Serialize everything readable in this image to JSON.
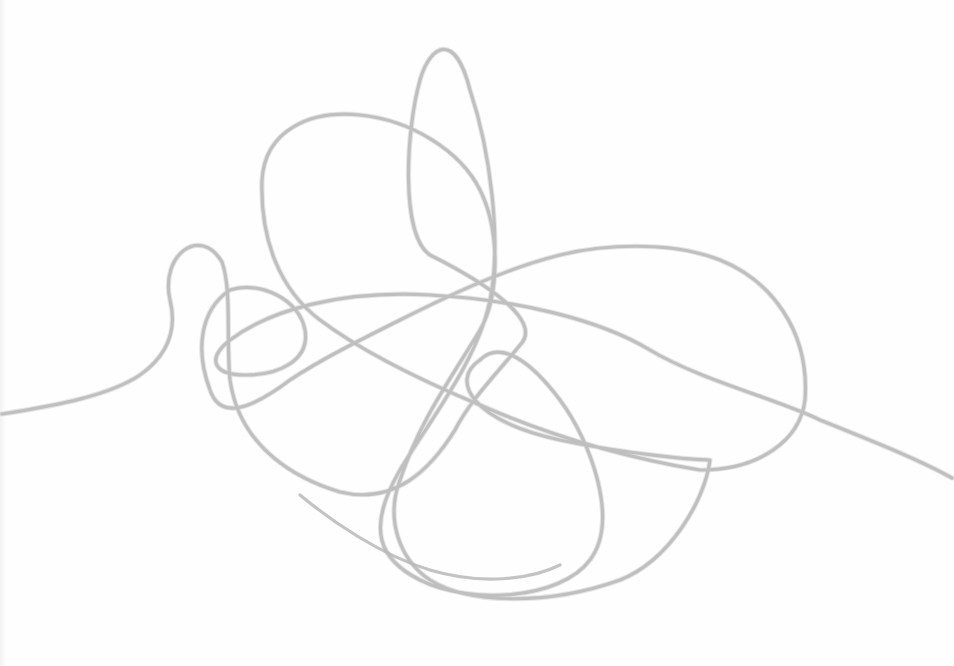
{
  "image": {
    "description": "Pencil scribble — a single continuous looping line on white paper",
    "background_color": "#fefefe",
    "stroke_color": "#b8b8b8",
    "stroke_shadow_color": "#d4d4d4",
    "stroke_width": 3.2,
    "path": "M 2 414 C 60 405 110 395 140 375 C 175 350 175 320 170 300 C 160 255 200 225 222 262 C 232 290 226 340 230 380 C 240 450 300 480 340 492 C 395 505 430 470 455 430 C 470 400 500 370 520 345 C 545 320 480 280 430 255 C 400 235 406 130 420 80 C 430 45 455 30 470 90 C 490 150 502 240 490 300 C 478 360 430 420 400 470 C 365 530 380 560 420 580 C 470 605 560 600 590 560 C 620 520 590 440 560 400 C 530 360 500 340 480 360 C 450 380 470 420 560 440 C 630 455 700 460 710 460 C 705 500 670 560 620 580 C 550 605 470 605 430 580 C 400 560 385 520 400 480 C 420 420 450 380 480 330 C 500 295 500 230 480 190 C 460 150 410 120 360 115 C 310 110 265 130 262 180 C 260 240 280 290 320 320 C 360 350 420 380 480 405 C 560 440 640 460 700 470 C 760 470 800 440 805 400 C 810 330 770 280 720 260 C 670 240 600 245 560 255 C 500 270 440 300 400 320 C 360 340 320 360 290 380 C 250 410 220 420 210 390 C 195 350 200 310 230 290 C 260 280 300 300 305 330 C 310 360 280 375 245 375 C 215 375 205 360 230 340 C 270 310 340 290 430 295 C 520 300 600 320 650 350 C 700 380 780 400 820 420 C 870 440 920 460 952 478",
    "secondary_path": "M 300 495 C 330 520 380 555 430 570 C 480 585 530 580 560 565"
  }
}
